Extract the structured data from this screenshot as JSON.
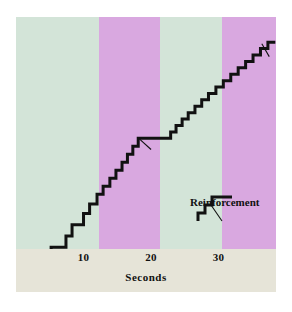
{
  "figure": {
    "axis_title": "Seconds",
    "legend_label": "Reinforcement",
    "colors": {
      "band_mint": "#d3e4d8",
      "band_purple": "#d9a8e0",
      "axis_strip": "#e6e4d8",
      "page": "#ffffff",
      "curve": "#111111",
      "reinforcement_mark": "#cc2418",
      "pointer": "#111111",
      "tick_text": "#111111"
    }
  },
  "chart_data": {
    "type": "line",
    "title": "",
    "subtitle": "",
    "xlabel": "Seconds",
    "ylabel": "",
    "grid": false,
    "legend_position": "inset-right",
    "xlim": [
      0,
      38.5
    ],
    "ylim": [
      0,
      100
    ],
    "xticks": [
      10,
      20,
      30
    ],
    "xtick_labels": [
      "10",
      "20",
      "30"
    ],
    "yticks": [],
    "ytick_labels": [],
    "series": [
      {
        "name": "Cumulative responses",
        "style": "step-post",
        "color": "#111111",
        "x": [
          0.0,
          1.4,
          1.4,
          2.1,
          2.1,
          4.4,
          4.4,
          5.2,
          5.2,
          7.4,
          7.4,
          8.3,
          8.3,
          10.0,
          10.0,
          10.9,
          10.9,
          12.0,
          12.0,
          12.9,
          12.9,
          13.9,
          13.9,
          14.8,
          14.8,
          15.7,
          15.7,
          16.5,
          16.5,
          17.3,
          17.3,
          18.1,
          18.1,
          22.1,
          22.1,
          22.9,
          22.9,
          23.7,
          23.7,
          24.6,
          24.6,
          25.5,
          25.5,
          26.5,
          26.5,
          27.5,
          27.5,
          28.5,
          28.5,
          29.6,
          29.6,
          30.7,
          30.7,
          31.8,
          31.8,
          32.9,
          32.9,
          34.0,
          34.0,
          35.1,
          35.1,
          36.2,
          36.2,
          37.3,
          37.3,
          38.4
        ],
        "y": [
          3.0,
          3.0,
          9.0,
          9.0,
          9.0,
          9.0,
          16.0,
          16.0,
          23.0,
          23.0,
          30.0,
          30.0,
          37.0,
          37.0,
          44.0,
          44.0,
          50.0,
          50.0,
          56.0,
          56.0,
          61.0,
          61.0,
          66.0,
          66.0,
          71.0,
          71.0,
          76.0,
          76.0,
          81.0,
          81.0,
          86.0,
          86.0,
          91.0,
          91.0,
          91.0,
          91.0,
          95.0,
          95.0,
          99.0,
          99.0,
          103.0,
          103.0,
          107.0,
          107.0,
          111.0,
          111.0,
          115.0,
          115.0,
          119.0,
          119.0,
          123.0,
          123.0,
          127.0,
          127.0,
          131.0,
          131.0,
          135.0,
          135.0,
          139.0,
          139.0,
          143.0,
          143.0,
          147.0,
          147.0,
          151.0,
          151.0
        ]
      }
    ],
    "shaded_bands": [
      {
        "label": "interval-1",
        "x0": 0.0,
        "x1": 12.3,
        "color": "#d3e4d8"
      },
      {
        "label": "interval-2",
        "x0": 12.3,
        "x1": 21.3,
        "color": "#d9a8e0"
      },
      {
        "label": "interval-3",
        "x0": 21.3,
        "x1": 30.5,
        "color": "#d3e4d8"
      },
      {
        "label": "interval-4",
        "x0": 30.5,
        "x1": 38.5,
        "color": "#d9a8e0"
      }
    ],
    "annotations": [
      {
        "label": "reinforcement-mark-1",
        "type": "highlighted-segment",
        "color": "#cc2418",
        "x0": 2.1,
        "x1": 4.4,
        "y": 9.0
      },
      {
        "label": "pointer-1",
        "type": "pointer-line",
        "x0": 3.0,
        "y0": 1.0,
        "x1": 1.6,
        "y1": 7.5
      },
      {
        "label": "pointer-2",
        "type": "pointer-line",
        "x0": 20.0,
        "y0": 84.0,
        "x1": 18.3,
        "y1": 90.5
      },
      {
        "label": "pointer-3",
        "type": "pointer-line",
        "x0": 37.5,
        "y0": 142.0,
        "x1": 36.4,
        "y1": 150.0
      }
    ]
  },
  "legend": {
    "label": "Reinforcement",
    "mini_series": {
      "name": "reinforcement-step-sample",
      "points": [
        [
          0,
          0
        ],
        [
          0,
          8
        ],
        [
          7,
          8
        ],
        [
          7,
          16
        ],
        [
          14,
          16
        ],
        [
          14,
          24
        ],
        [
          34,
          24
        ]
      ]
    },
    "pointer": {
      "x0": 24,
      "y0": 30,
      "x1": 13,
      "y1": 16
    }
  }
}
